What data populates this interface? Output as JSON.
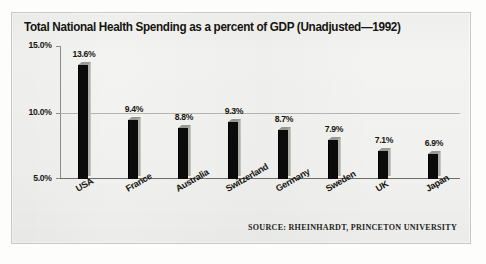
{
  "chart_data": {
    "type": "bar",
    "title": "Total National Health Spending as a percent of GDP (Unadjusted—1992)",
    "xlabel": "",
    "ylabel": "",
    "categories": [
      "USA",
      "France",
      "Australia",
      "Switzerland",
      "Germany",
      "Sweden",
      "UK",
      "Japan"
    ],
    "values": [
      13.6,
      9.4,
      8.8,
      9.3,
      8.7,
      7.9,
      7.1,
      6.9
    ],
    "value_labels": [
      "13.6%",
      "9.4%",
      "8.8%",
      "9.3%",
      "8.7%",
      "7.9%",
      "7.1%",
      "6.9%"
    ],
    "ylim": [
      5.0,
      15.0
    ],
    "yticks": [
      5.0,
      10.0,
      15.0
    ],
    "ytick_labels": [
      "5.0%",
      "10.0%",
      "15.0%"
    ],
    "grid": "horizontal-at-10-percent",
    "legend": "none",
    "bar_style": "3d-black-front-gray-side",
    "annotations": [
      "SOURCE: RHEINHARDT, PRINCETON UNIVERSITY"
    ]
  },
  "source_note": "SOURCE: RHEINHARDT, PRINCETON UNIVERSITY",
  "colors": {
    "bar_front": "#0b0b0b",
    "bar_side": "#b0b0aa",
    "panel_bg": "#f3f3f1",
    "panel_border": "#c9c9c5",
    "axis": "#8e8e88",
    "gridline": "#b8b8b2",
    "text": "#17170f"
  }
}
